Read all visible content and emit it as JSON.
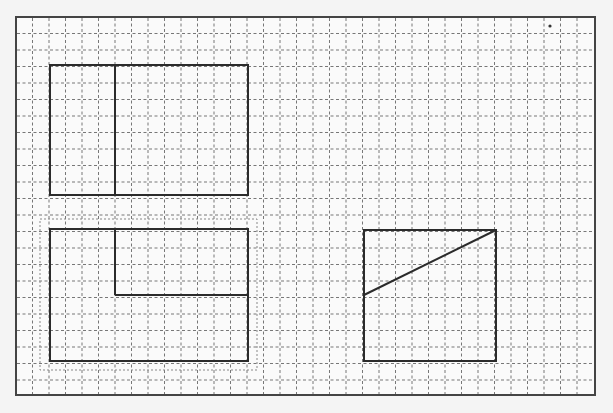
{
  "canvas": {
    "width": 613,
    "height": 413,
    "background": "#f4f4f4",
    "frame": {
      "x": 16,
      "y": 17,
      "width": 579,
      "height": 378,
      "stroke": "#444444",
      "fill": "#fafafa"
    },
    "grid": {
      "origin_x": 16,
      "origin_y": 17,
      "spacing": 16.5,
      "stroke": "#777777",
      "dash": "3,2.5"
    },
    "marker_dot": {
      "x": 550,
      "y": 26,
      "r": 1.6,
      "fill": "#333333"
    }
  },
  "shapes": [
    {
      "id": "top-left-shape",
      "rect": {
        "x": 50,
        "y": 65,
        "width": 198,
        "height": 130
      },
      "lines": [
        {
          "x1": 115,
          "y1": 65,
          "x2": 115,
          "y2": 195
        }
      ]
    },
    {
      "id": "bottom-left-shape",
      "selected": true,
      "selection_box": {
        "x": 40,
        "y": 219,
        "width": 217,
        "height": 151
      },
      "rect": {
        "x": 50,
        "y": 229,
        "width": 198,
        "height": 132
      },
      "lines": [
        {
          "x1": 115,
          "y1": 229,
          "x2": 115,
          "y2": 295
        },
        {
          "x1": 115,
          "y1": 295,
          "x2": 248,
          "y2": 295
        }
      ]
    },
    {
      "id": "right-shape",
      "rect": {
        "x": 364,
        "y": 230,
        "width": 132,
        "height": 131
      },
      "lines": [
        {
          "x1": 364,
          "y1": 295,
          "x2": 496,
          "y2": 230
        }
      ]
    }
  ],
  "style": {
    "shape_stroke": "#2b2b2b",
    "shape_stroke_width": 2,
    "selection_stroke": "#888888"
  }
}
